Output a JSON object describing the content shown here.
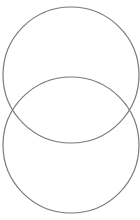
{
  "diagram": {
    "type": "venn",
    "background": "#ffffff",
    "stroke_color": "#7a7a7a",
    "stroke_width": 1.2,
    "circles": [
      {
        "id": "upper",
        "cx": 71,
        "cy": 75,
        "r": 68
      },
      {
        "id": "lower",
        "cx": 71,
        "cy": 145,
        "r": 68
      }
    ]
  }
}
